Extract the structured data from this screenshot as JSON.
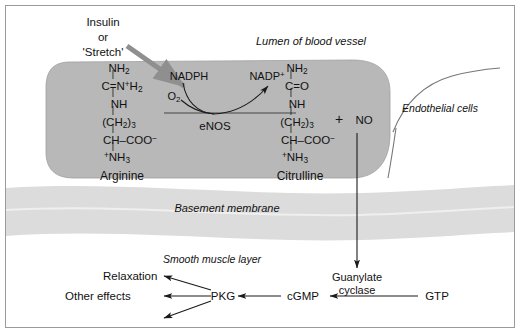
{
  "figure": {
    "title_regions": {
      "lumen": "Lumen of blood vessel",
      "endothelial": "Endothelial cells",
      "basement": "Basement membrane",
      "smooth_muscle": "Smooth muscle layer"
    },
    "stimulus": {
      "line1": "Insulin",
      "line2": "or",
      "line3": "'Stretch'"
    },
    "substrate": {
      "name": "Arginine",
      "structure": [
        {
          "main": "NH",
          "sub": "2",
          "sup": ""
        },
        {
          "main": "C=N",
          "sub": "2",
          "sup": "+",
          "tail": "H"
        },
        {
          "main": "NH",
          "sub": "",
          "sup": ""
        },
        {
          "main": "(CH",
          "sub": "2",
          "sup": "",
          "tail2": ")",
          "sub2": "3"
        },
        {
          "main": "CH–COO",
          "sub": "",
          "sup": "−"
        },
        {
          "main": "NH",
          "sub": "3",
          "sup": "",
          "pre": "+"
        }
      ]
    },
    "product": {
      "name": "Citrulline",
      "structure": [
        {
          "main": "NH",
          "sub": "2",
          "sup": ""
        },
        {
          "main": "C=O",
          "sub": "",
          "sup": ""
        },
        {
          "main": "NH",
          "sub": "",
          "sup": ""
        },
        {
          "main": "(CH",
          "sub": "2",
          "sup": "",
          "tail2": ")",
          "sub2": "3"
        },
        {
          "main": "CH–COO",
          "sub": "",
          "sup": "−"
        },
        {
          "main": "NH",
          "sub": "3",
          "sup": "",
          "pre": "+"
        }
      ]
    },
    "enzyme": "eNOS",
    "cofactor_in": "NADPH",
    "oxygen": "O",
    "oxygen_sub": "2",
    "cofactor_out": "NADP",
    "cofactor_out_sup": "+",
    "plus": "+",
    "nitric_oxide": "NO",
    "cascade": {
      "guanylate_cyclase_line1": "Guanylate",
      "guanylate_cyclase_line2": "cyclase",
      "gtp": "GTP",
      "cgmp": "cGMP",
      "pkg": "PKG",
      "relaxation": "Relaxation",
      "other_effects": "Other effects"
    },
    "colors": {
      "cell_fill": "#b8b8b8",
      "membrane_fill": "#dcdcdc",
      "stimulus_arrow": "#8f8f8f",
      "stroke": "#1a1a1a",
      "frame": "#9a9a9a"
    }
  }
}
